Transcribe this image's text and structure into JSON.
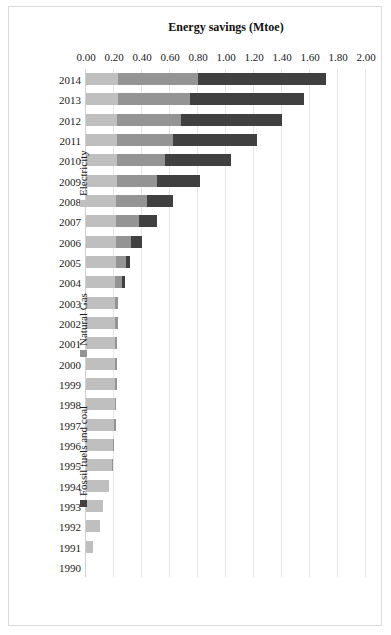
{
  "chart_data": {
    "type": "bar",
    "orientation": "horizontal",
    "stacked": true,
    "title": "",
    "xlabel": "Energy savings (Mtoe)",
    "ylabel": "",
    "grid": true,
    "legend_position": "right",
    "xlim": [
      0.0,
      2.0
    ],
    "xticks": [
      "0.00",
      "0.20",
      "0.40",
      "0.60",
      "0.80",
      "1.00",
      "1.20",
      "1.40",
      "1.60",
      "1.80",
      "2.00"
    ],
    "categories": [
      "1990",
      "1991",
      "1992",
      "1993",
      "1994",
      "1995",
      "1996",
      "1997",
      "1998",
      "1999",
      "2000",
      "2001",
      "2002",
      "2003",
      "2004",
      "2005",
      "2006",
      "2007",
      "2008",
      "2009",
      "2010",
      "2011",
      "2012",
      "2013",
      "2014"
    ],
    "series": [
      {
        "name": "Electricity",
        "color": "#bfbfbf",
        "values": [
          0.0,
          0.052,
          0.1,
          0.119,
          0.162,
          0.188,
          0.196,
          0.203,
          0.206,
          0.208,
          0.21,
          0.208,
          0.208,
          0.207,
          0.21,
          0.212,
          0.213,
          0.214,
          0.216,
          0.22,
          0.22,
          0.222,
          0.224,
          0.226,
          0.228
        ]
      },
      {
        "name": "Natural Gas",
        "color": "#949494",
        "values": [
          0.0,
          0.0,
          0.0,
          0.0,
          0.0,
          0.004,
          0.006,
          0.008,
          0.01,
          0.012,
          0.014,
          0.016,
          0.018,
          0.02,
          0.048,
          0.072,
          0.109,
          0.164,
          0.219,
          0.29,
          0.345,
          0.402,
          0.456,
          0.52,
          0.572
        ]
      },
      {
        "name": "Fossil fuels and coal",
        "color": "#404040",
        "values": [
          0.0,
          0.0,
          0.0,
          0.0,
          0.0,
          0.0,
          0.0,
          0.0,
          0.0,
          0.0,
          0.0,
          0.0,
          0.0,
          0.0,
          0.02,
          0.034,
          0.079,
          0.128,
          0.19,
          0.306,
          0.473,
          0.6,
          0.72,
          0.81,
          0.918
        ]
      }
    ],
    "totals": [
      0.0,
      0.052,
      0.1,
      0.119,
      0.162,
      0.192,
      0.202,
      0.211,
      0.216,
      0.22,
      0.224,
      0.224,
      0.226,
      0.227,
      0.278,
      0.318,
      0.401,
      0.506,
      0.625,
      0.816,
      1.038,
      1.224,
      1.4,
      1.556,
      1.718
    ]
  },
  "axis": {
    "value_axis_title": "Energy savings (Mtoe)"
  },
  "legend": {
    "items": [
      {
        "label": "Fossil fuels and coal",
        "color": "#404040",
        "marker": "square-marker"
      },
      {
        "label": "Natural Gas",
        "color": "#949494",
        "marker": "square-marker"
      },
      {
        "label": "Electricity",
        "color": "#bfbfbf",
        "marker": "square-marker"
      }
    ]
  }
}
